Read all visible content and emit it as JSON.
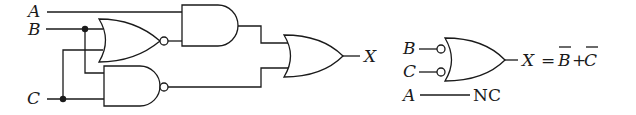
{
  "diagram": {
    "type": "logic-circuit",
    "left_circuit": {
      "inputs": [
        "A",
        "B",
        "C"
      ],
      "output": "X",
      "gates": [
        {
          "id": "g1",
          "type": "NOR",
          "inputs": [
            "B",
            "C"
          ]
        },
        {
          "id": "g2",
          "type": "NAND",
          "inputs": [
            "B",
            "C"
          ]
        },
        {
          "id": "g3",
          "type": "AND",
          "inputs": [
            "A",
            "g1"
          ]
        },
        {
          "id": "g4",
          "type": "OR",
          "inputs": [
            "g3",
            "g2"
          ]
        }
      ]
    },
    "right_circuit": {
      "gate_type": "OR with inverted inputs",
      "inputs": [
        "B",
        "C"
      ],
      "output_label": "X",
      "equation": "X = B̄+C̄",
      "eq_lhs": "X =",
      "eq_b": "B",
      "eq_plus": "+",
      "eq_c": "C",
      "unused_input": "A",
      "unused_label": "NC"
    }
  },
  "labels": {
    "A": "A",
    "B": "B",
    "C": "C",
    "X": "X",
    "NC": "NC"
  }
}
